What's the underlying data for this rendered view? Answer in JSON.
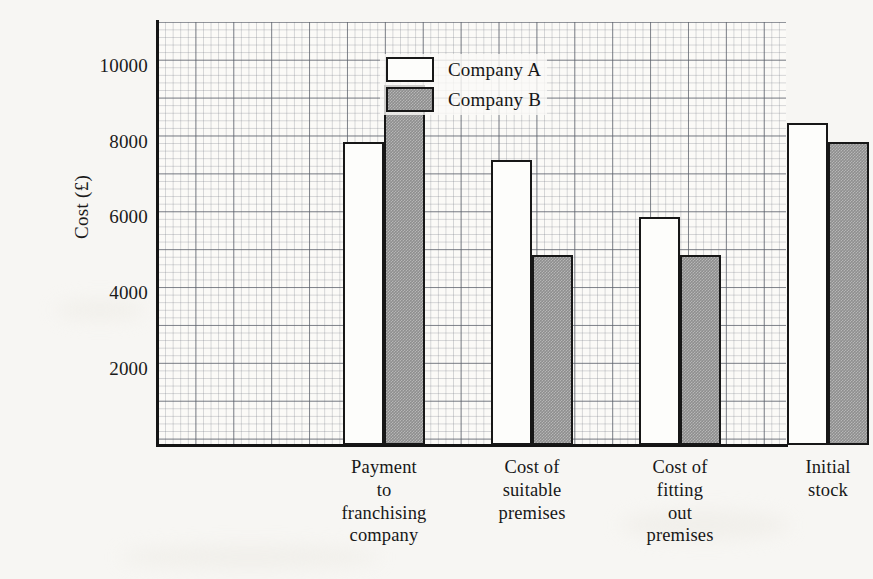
{
  "chart_data": {
    "type": "bar",
    "title": "",
    "xlabel": "",
    "ylabel": "Cost (£)",
    "categories": [
      "Payment\nto\nfranchising\ncompany",
      "Cost of\nsuitable\npremises",
      "Cost of\nfitting\nout\npremises",
      "Initial\nstock"
    ],
    "series": [
      {
        "name": "Company A",
        "values": [
          8000,
          7500,
          6000,
          8500
        ],
        "fill": "#ffffff"
      },
      {
        "name": "Company B",
        "values": [
          9500,
          5000,
          5000,
          8000
        ],
        "fill": "#8e8e8e"
      }
    ],
    "ylim": [
      0,
      11150
    ],
    "yticks": [
      2000,
      4000,
      6000,
      8000,
      10000
    ],
    "ytick_labels": [
      "2000",
      "4000",
      "6000",
      "8000",
      "10000"
    ],
    "grid": true,
    "grid_style": "graph-paper",
    "legend_position": "upper center inside"
  },
  "legend": {
    "entries": [
      {
        "label": "Company A"
      },
      {
        "label": "Company B"
      }
    ]
  },
  "axes": {
    "y_title": "Cost (£)"
  }
}
